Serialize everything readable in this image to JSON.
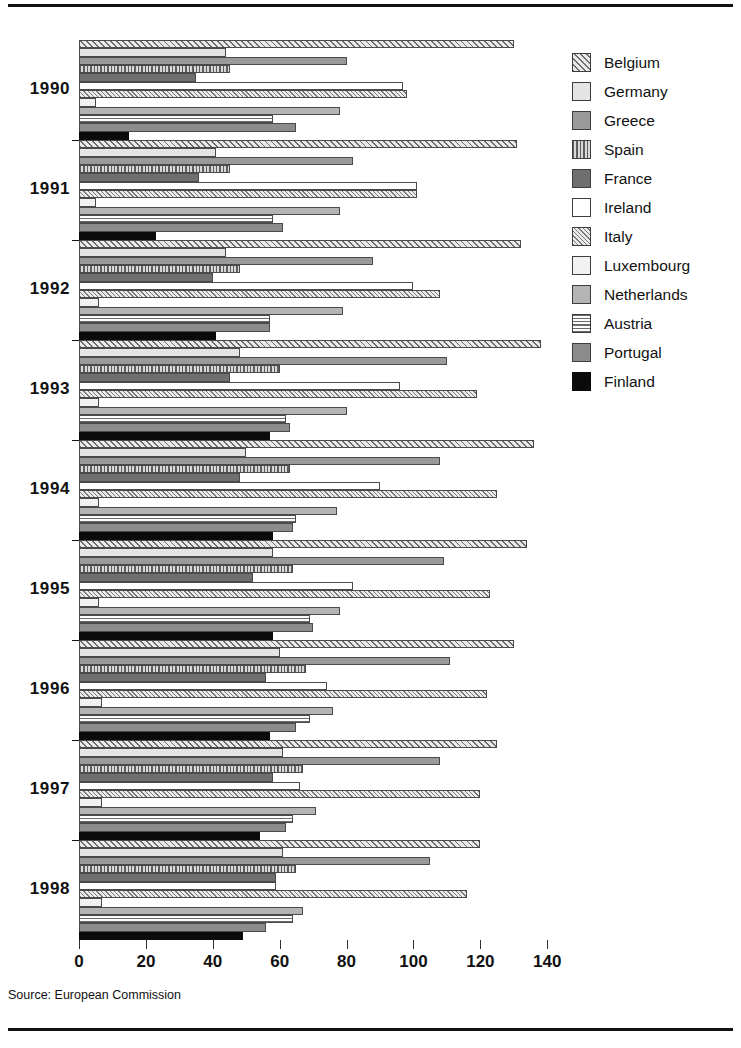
{
  "source_note": "Source: European Commission",
  "legend": {
    "items": [
      {
        "label": "Belgium",
        "key": "belgium"
      },
      {
        "label": "Germany",
        "key": "germany"
      },
      {
        "label": "Greece",
        "key": "greece"
      },
      {
        "label": "Spain",
        "key": "spain"
      },
      {
        "label": "France",
        "key": "france"
      },
      {
        "label": "Ireland",
        "key": "ireland"
      },
      {
        "label": "Italy",
        "key": "italy"
      },
      {
        "label": "Luxembourg",
        "key": "luxembourg"
      },
      {
        "label": "Netherlands",
        "key": "netherlands"
      },
      {
        "label": "Austria",
        "key": "austria"
      },
      {
        "label": "Portugal",
        "key": "portugal"
      },
      {
        "label": "Finland",
        "key": "finland"
      }
    ]
  },
  "chart_data": {
    "type": "bar",
    "orientation": "horizontal",
    "title": "",
    "subtitle": "",
    "xlabel": "",
    "ylabel": "",
    "xlim": [
      0,
      145
    ],
    "xticks": [
      0,
      20,
      40,
      60,
      80,
      100,
      120,
      140
    ],
    "xticklabels": [
      "0",
      "20",
      "40",
      "60",
      "80",
      "100",
      "120",
      "140"
    ],
    "grid": false,
    "legend_position": "right",
    "categories": [
      "1990",
      "1991",
      "1992",
      "1993",
      "1994",
      "1995",
      "1996",
      "1997",
      "1998"
    ],
    "series": [
      {
        "name": "Belgium",
        "key": "belgium",
        "values": [
          130,
          131,
          132,
          138,
          136,
          134,
          130,
          125,
          120
        ]
      },
      {
        "name": "Germany",
        "key": "germany",
        "values": [
          44,
          41,
          44,
          48,
          50,
          58,
          60,
          61,
          61
        ]
      },
      {
        "name": "Greece",
        "key": "greece",
        "values": [
          80,
          82,
          88,
          110,
          108,
          109,
          111,
          108,
          105
        ]
      },
      {
        "name": "Spain",
        "key": "spain",
        "values": [
          45,
          45,
          48,
          60,
          63,
          64,
          68,
          67,
          65
        ]
      },
      {
        "name": "France",
        "key": "france",
        "values": [
          35,
          36,
          40,
          45,
          48,
          52,
          56,
          58,
          59
        ]
      },
      {
        "name": "Ireland",
        "key": "ireland",
        "values": [
          97,
          101,
          100,
          96,
          90,
          82,
          74,
          66,
          59
        ]
      },
      {
        "name": "Italy",
        "key": "italy",
        "values": [
          98,
          101,
          108,
          119,
          125,
          123,
          122,
          120,
          116
        ]
      },
      {
        "name": "Luxembourg",
        "key": "luxembourg",
        "values": [
          5,
          5,
          6,
          6,
          6,
          6,
          7,
          7,
          7
        ]
      },
      {
        "name": "Netherlands",
        "key": "netherlands",
        "values": [
          78,
          78,
          79,
          80,
          77,
          78,
          76,
          71,
          67
        ]
      },
      {
        "name": "Austria",
        "key": "austria",
        "values": [
          58,
          58,
          57,
          62,
          65,
          69,
          69,
          64,
          64
        ]
      },
      {
        "name": "Portugal",
        "key": "portugal",
        "values": [
          65,
          61,
          57,
          63,
          64,
          70,
          65,
          62,
          56
        ]
      },
      {
        "name": "Finland",
        "key": "finland",
        "values": [
          15,
          23,
          41,
          57,
          58,
          58,
          57,
          54,
          49
        ]
      }
    ]
  }
}
